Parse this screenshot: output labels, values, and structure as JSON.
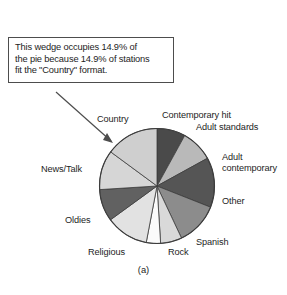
{
  "figure": {
    "caption": "(a)",
    "callout": {
      "lines": [
        "This wedge occupies 14.9% of",
        "the pie because 14.9% of stations",
        "fit the \"Country\"  format."
      ],
      "points_to": "Country",
      "border_color": "#4d4d4d"
    }
  },
  "chart_data": {
    "type": "pie",
    "title": "",
    "subtitle": "",
    "xlabel": "",
    "ylabel": "",
    "legend_position": "labels-around-pie",
    "grid": false,
    "start_angle_deg": 0,
    "direction": "clockwise",
    "units": "percent of stations",
    "categories": [
      "Contemporary hit",
      "Adult standards",
      "Adult contemporary",
      "Other",
      "Spanish",
      "Rock",
      "Religious",
      "Oldies",
      "News/Talk",
      "Country"
    ],
    "values": [
      8.0,
      9.0,
      14.0,
      12.0,
      6.0,
      4.0,
      12.0,
      9.0,
      11.1,
      14.9
    ],
    "colors": [
      "#4a4a4a",
      "#b9b9b9",
      "#555555",
      "#8c8c8c",
      "#d9d9d9",
      "#fbfbfb",
      "#e2e2e2",
      "#616161",
      "#d6d6d6",
      "#cfcfcf"
    ],
    "slice_edge_color": "#3c3c3c",
    "labels": [
      {
        "text": "Contemporary hit",
        "x": 162,
        "y": 110
      },
      {
        "text": "Adult standards",
        "x": 196,
        "y": 122
      },
      {
        "text": "Adult",
        "x": 222,
        "y": 152
      },
      {
        "text": "contemporary",
        "x": 222,
        "y": 163
      },
      {
        "text": "Other",
        "x": 222,
        "y": 196
      },
      {
        "text": "Spanish",
        "x": 196,
        "y": 237
      },
      {
        "text": "Rock",
        "x": 168,
        "y": 247
      },
      {
        "text": "Religious",
        "x": 88,
        "y": 247
      },
      {
        "text": "Oldies",
        "x": 65,
        "y": 215
      },
      {
        "text": "News/Talk",
        "x": 41,
        "y": 164
      },
      {
        "text": "Country",
        "x": 97,
        "y": 114
      }
    ]
  }
}
